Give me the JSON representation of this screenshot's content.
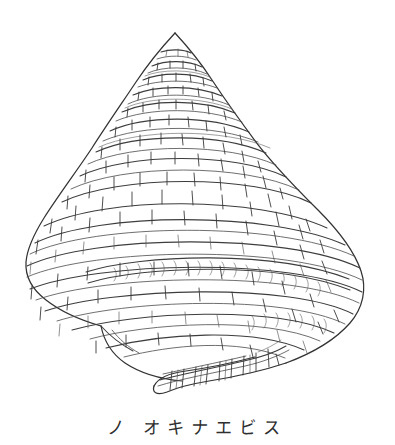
{
  "plate": {
    "background_color": "#ffffff",
    "ink_color": "#3a3a3a",
    "ink_color_light": "#6d6d6d",
    "medium": "pen-and-ink line drawing",
    "subject": "conical slit shell (Mikadotrochus) seen from the side"
  },
  "caption": {
    "text": "ノ オキナエビス",
    "script": "katakana",
    "alignment": "center"
  },
  "figure": {
    "apex": {
      "x": 175,
      "y": 33
    },
    "extent": {
      "left": 25,
      "right": 366,
      "top": 31,
      "bottom": 398
    },
    "whorl_count": 9,
    "features": [
      "stepped conical spire",
      "spiral cord banding",
      "axial cross-hatch tick marks",
      "selenizone slit band with crescent growth lines",
      "flaring body whorl",
      "extended aperture lip lobe at lower left"
    ]
  }
}
